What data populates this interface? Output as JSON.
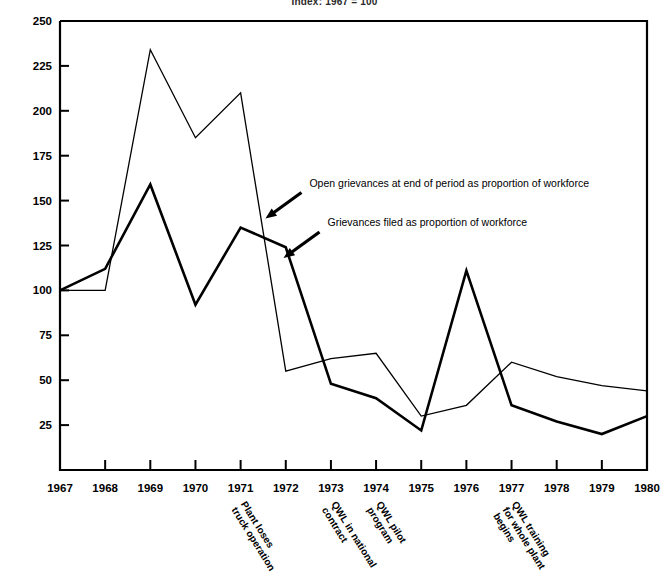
{
  "chart_data": {
    "type": "line",
    "title": "Index: 1967 = 100",
    "xlabel": "",
    "ylabel": "",
    "x": [
      1967,
      1968,
      1969,
      1970,
      1971,
      1972,
      1973,
      1974,
      1975,
      1976,
      1977,
      1978,
      1979,
      1980
    ],
    "xtick_labels": [
      "1967",
      "1968",
      "1969",
      "1970",
      "1971",
      "1972",
      "1973",
      "1974",
      "1975",
      "1976",
      "1977",
      "1978",
      "1979",
      "1980"
    ],
    "ytick_labels": [
      "250",
      "225",
      "200",
      "175",
      "150",
      "125",
      "100",
      "75",
      "50",
      "25"
    ],
    "yticks": [
      250,
      225,
      200,
      175,
      150,
      125,
      100,
      75,
      50,
      25
    ],
    "ylim": [
      0,
      250
    ],
    "xlim": [
      1967,
      1980
    ],
    "grid": false,
    "legend_position": "inline-annotations",
    "series": [
      {
        "name": "Open grievances at end of period as proportion of workforce",
        "values": [
          100,
          100,
          234,
          185,
          210,
          55,
          62,
          65,
          30,
          36,
          60,
          52,
          47,
          44
        ],
        "stroke_width": 1.3
      },
      {
        "name": "Grievances filed as proportion of workforce",
        "values": [
          100,
          112,
          159,
          92,
          135,
          124,
          48,
          40,
          22,
          111,
          36,
          27,
          20,
          30
        ],
        "stroke_width": 2.6
      }
    ],
    "annotations": [
      {
        "text": "Open grievances at end of period as proportion of workforce",
        "target_x": 1971.55,
        "target_y": 140
      },
      {
        "text": "Grievances filed as proportion of workforce",
        "target_x": 1971.95,
        "target_y": 118
      }
    ],
    "event_labels": [
      {
        "text_lines": [
          "Plant loses",
          "truck operation"
        ],
        "at_x": 1971
      },
      {
        "text_lines": [
          "QWL in national",
          "contract"
        ],
        "at_x": 1973
      },
      {
        "text_lines": [
          "QWL pilot",
          "program"
        ],
        "at_x": 1974
      },
      {
        "text_lines": [
          "QWL training",
          "for whole plant",
          "begins"
        ],
        "at_x": 1977
      }
    ],
    "colors": {
      "line": "#000000",
      "axis": "#000000",
      "background": "#ffffff"
    }
  }
}
